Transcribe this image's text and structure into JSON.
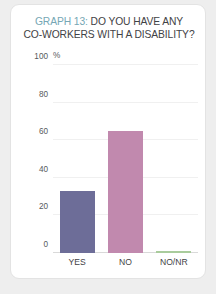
{
  "card": {
    "background": "#ffffff",
    "border_color": "#e3e3e3"
  },
  "title": {
    "tag": "GRAPH 13:",
    "tag_color": "#76a7b5",
    "rest": " DO YOU HAVE ANY",
    "line2": "CO-WORKERS WITH A DISABILITY?",
    "color": "#3f4245"
  },
  "chart_data": {
    "type": "bar",
    "title": "GRAPH 13: DO YOU HAVE ANY CO-WORKERS WITH A DISABILITY?",
    "xlabel": "",
    "ylabel": "%",
    "categories": [
      "YES",
      "NO",
      "NO/NR"
    ],
    "values": [
      33,
      65,
      1
    ],
    "colors": [
      "#6d6d98",
      "#c189ae",
      "#a9cc9c"
    ],
    "ylim": [
      0,
      100
    ],
    "yticks": [
      0,
      20,
      40,
      60,
      80,
      100
    ],
    "ytick_labels": [
      "0",
      "20",
      "40",
      "60",
      "80",
      "100"
    ],
    "grid": true,
    "legend": false
  }
}
